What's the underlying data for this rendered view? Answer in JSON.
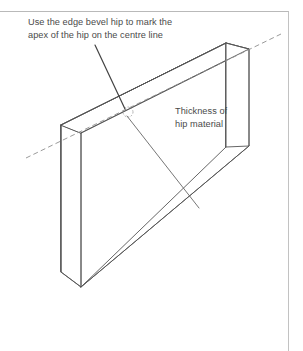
{
  "figure": {
    "type": "technical-isometric-diagram",
    "background_color": "#ffffff",
    "line_color": "#555555",
    "text_color": "#4a4a4a",
    "frame": {
      "top_rule": true,
      "right_rule": true,
      "color": "#b9b9b9"
    },
    "annotations": {
      "apex": {
        "line1": "Use the edge bevel hip to mark the",
        "line2": "apex of the hip on the centre line"
      },
      "thickness": {
        "line1": "Thickness of",
        "line2": "hip material"
      }
    },
    "geometry": {
      "front_face": "61,125 226,43 226,147 81,287",
      "top_face": "61,125 226,43 249,49 81,133",
      "end_face": "61,125 81,133 81,287 61,272",
      "right_edge_top": "249,49",
      "right_edge_bottom": "249,146",
      "centre_line": {
        "from_x": 26,
        "from_y": 158,
        "to_x": 281,
        "to_y": 34,
        "style": "dashed"
      },
      "apex_mark": {
        "x": 128,
        "y": 112,
        "r": 5
      },
      "leader_apex": {
        "x1": 95,
        "y1": 45,
        "x2": 125,
        "y2": 109
      },
      "leader_thickness": {
        "x1": 127,
        "y1": 116,
        "x2": 199,
        "y2": 208
      }
    }
  }
}
